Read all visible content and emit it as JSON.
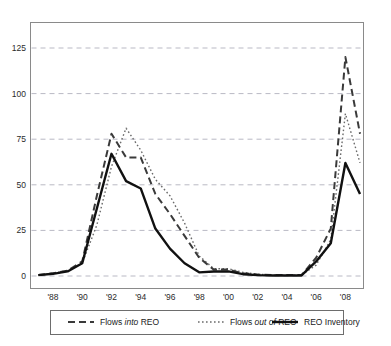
{
  "chart_data": {
    "type": "line",
    "title": "",
    "subtitle": "",
    "xlabel": "",
    "ylabel": "",
    "xlim": [
      1987,
      2009
    ],
    "ylim": [
      -6,
      134
    ],
    "yticks": [
      0,
      25,
      50,
      75,
      100,
      125
    ],
    "ytick_labels": [
      "0",
      "25",
      "50",
      "75",
      "100",
      "125"
    ],
    "xticks": [
      1988,
      1990,
      1992,
      1994,
      1996,
      1998,
      2000,
      2002,
      2004,
      2006,
      2008
    ],
    "xtick_labels": [
      "'88",
      "'90",
      "'92",
      "'94",
      "'96",
      "'98",
      "'00",
      "'02",
      "'04",
      "'06",
      "'08"
    ],
    "grid": "horizontal-dashed",
    "legend_position": "bottom",
    "x": [
      1987,
      1988,
      1989,
      1990,
      1991,
      1992,
      1993,
      1994,
      1995,
      1996,
      1997,
      1998,
      1999,
      2000,
      2001,
      2002,
      2003,
      2004,
      2005,
      2006,
      2007,
      2008,
      2009
    ],
    "series": [
      {
        "name": "Flows into REO",
        "name_plain": "Flows ",
        "name_italic": "into",
        "name_tail": " REO",
        "style": "dashed",
        "color": "#3a3a3a",
        "width": 2.0,
        "values": [
          0.5,
          1.5,
          3,
          8,
          44,
          78,
          65,
          65,
          45,
          34,
          22,
          10,
          3.5,
          3.5,
          1.5,
          0.8,
          0.5,
          0.5,
          0.5,
          10,
          26,
          120,
          78
        ]
      },
      {
        "name": "Flows out of REO",
        "name_plain": "Flows ",
        "name_italic": "out of",
        "name_tail": " REO",
        "style": "dotted",
        "color": "#6b6b6b",
        "width": 1.4,
        "values": [
          0.5,
          1.5,
          3,
          7,
          28,
          60,
          81,
          69,
          53,
          44,
          29,
          11,
          4,
          4,
          2,
          1,
          0.5,
          0.5,
          0.5,
          6,
          20,
          89,
          62
        ]
      },
      {
        "name": "REO Inventory",
        "name_plain": "REO Inventory",
        "name_italic": "",
        "name_tail": "",
        "style": "solid",
        "color": "#111111",
        "width": 2.4,
        "values": [
          0.5,
          1.2,
          2.5,
          7,
          37,
          67,
          52,
          48,
          26,
          15,
          7,
          2,
          2.5,
          2.5,
          1,
          0.5,
          0.3,
          0.3,
          0.3,
          8,
          18,
          62,
          45
        ]
      }
    ]
  },
  "legend": {
    "items": [
      {
        "label_plain": "Flows ",
        "label_italic": "into",
        "label_tail": " REO",
        "style": "dashed"
      },
      {
        "label_plain": "Flows ",
        "label_italic": "out of",
        "label_tail": " REO",
        "style": "dotted"
      },
      {
        "label_plain": "REO Inventory",
        "label_italic": "",
        "label_tail": "",
        "style": "solid"
      }
    ]
  },
  "colors": {
    "plot_border": "#8a8a8a",
    "gridline": "#b9b9c4",
    "background": "#ffffff",
    "text": "#1a1a1a"
  }
}
